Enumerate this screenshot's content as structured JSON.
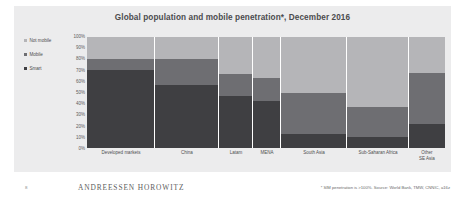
{
  "chart_data": {
    "type": "bar",
    "title": "Global population and mobile penetration*, December 2016",
    "xlabel": "",
    "ylabel": "",
    "ylim": [
      0,
      100
    ],
    "grid": false,
    "legend_position": "left",
    "stacked": true,
    "note": "Marimekko-style 100% stacked columns; column width proportional to population",
    "categories": [
      "Developed markets",
      "China",
      "Latam",
      "MENA",
      "South Asia",
      "Sub-Saharan Africa",
      "Other"
    ],
    "category_sublabels": [
      "",
      "",
      "",
      "",
      "",
      "",
      "SE Asia"
    ],
    "category_widths": [
      68,
      64,
      34,
      28,
      66,
      62,
      36
    ],
    "y_ticks": [
      "100%",
      "90%",
      "80%",
      "70%",
      "60%",
      "50%",
      "40%",
      "30%",
      "20%",
      "10%",
      "0%"
    ],
    "series": [
      {
        "name": "Smart",
        "color": "#3f3f42",
        "values": [
          70,
          57,
          47,
          42,
          13,
          10,
          22
        ]
      },
      {
        "name": "Mobile",
        "color": "#6e6e72",
        "values": [
          10,
          23,
          20,
          21,
          37,
          27,
          46
        ]
      },
      {
        "name": "Not mobile",
        "color": "#b5b5b8",
        "values": [
          20,
          20,
          33,
          37,
          50,
          63,
          32
        ]
      }
    ],
    "legend": [
      {
        "label": "Not mobile",
        "color": "#b5b5b8"
      },
      {
        "label": "Mobile",
        "color": "#6e6e72"
      },
      {
        "label": "Smart",
        "color": "#3f3f42"
      }
    ]
  },
  "footer": {
    "page_number": "8",
    "brand": "ANDREESSEN HOROWITZ",
    "source": "* SIM penetration is >100%. Source: World Bank, TMW, CNNIC, a16z"
  }
}
